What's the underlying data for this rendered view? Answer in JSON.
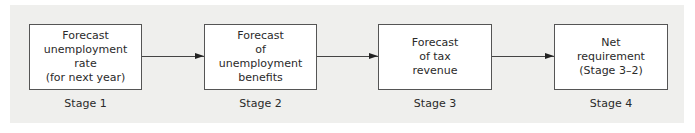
{
  "diagram": {
    "type": "flowchart",
    "direction": "left-to-right",
    "stages": [
      {
        "label": "Stage 1",
        "lines": [
          "Forecast",
          "unemployment",
          "rate",
          "(for next year)"
        ]
      },
      {
        "label": "Stage 2",
        "lines": [
          "Forecast",
          "of",
          "unemployment",
          "benefits"
        ]
      },
      {
        "label": "Stage 3",
        "lines": [
          "Forecast",
          "of tax",
          "revenue"
        ]
      },
      {
        "label": "Stage 4",
        "lines": [
          "Net",
          "requirement",
          "(Stage 3–2)"
        ]
      }
    ],
    "edges": [
      {
        "from": "Stage 1",
        "to": "Stage 2"
      },
      {
        "from": "Stage 2",
        "to": "Stage 3"
      },
      {
        "from": "Stage 3",
        "to": "Stage 4"
      }
    ]
  },
  "colors": {
    "panel_background": "#efefed",
    "box_fill": "#ffffff",
    "box_border": "#555555",
    "text": "#2a2a2a"
  }
}
